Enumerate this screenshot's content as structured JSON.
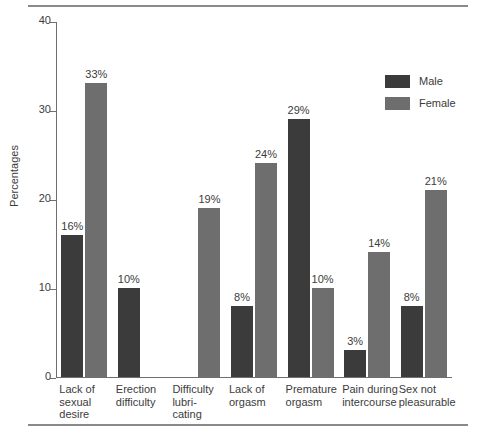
{
  "chart_data": {
    "type": "bar",
    "title": "",
    "xlabel": "",
    "ylabel": "Percentages",
    "ylim": [
      0,
      40
    ],
    "yticks": [
      "0",
      "10",
      "20",
      "30",
      "40"
    ],
    "grid": false,
    "legend_position": "top-right",
    "value_suffix": "%",
    "categories": [
      "Lack of\nsexual\ndesire",
      "Erection\ndifficulty",
      "Difficulty\nlubri-\ncating",
      "Lack of\norgasm",
      "Premature\norgasm",
      "Pain during\nintercourse",
      "Sex not\npleasurable"
    ],
    "series": [
      {
        "name": "Male",
        "color": "#3b3b3b",
        "values": [
          16,
          10,
          null,
          8,
          29,
          3,
          8
        ],
        "labels": [
          "16%",
          "10%",
          "",
          "8%",
          "29%",
          "3%",
          "8%"
        ]
      },
      {
        "name": "Female",
        "color": "#6e6e6e",
        "values": [
          33,
          null,
          19,
          24,
          10,
          14,
          21
        ],
        "labels": [
          "33%",
          "",
          "19%",
          "24%",
          "10%",
          "14%",
          "21%"
        ]
      }
    ]
  },
  "legend": {
    "items": [
      {
        "label": "Male",
        "color": "#3b3b3b"
      },
      {
        "label": "Female",
        "color": "#6e6e6e"
      }
    ]
  },
  "axis": {
    "y_label": "Percentages",
    "y_ticks": [
      "0",
      "10",
      "20",
      "30",
      "40"
    ]
  }
}
